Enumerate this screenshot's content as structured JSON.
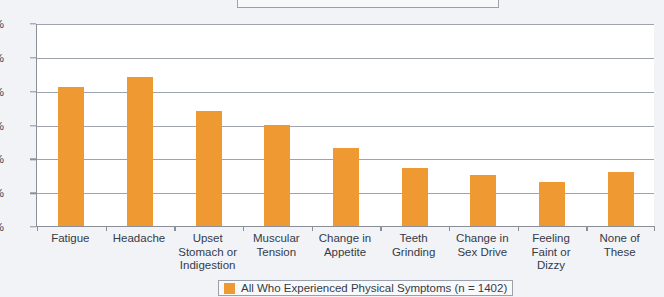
{
  "chart_data": {
    "type": "bar",
    "title": "",
    "xlabel": "",
    "ylabel": "",
    "ylim": [
      0,
      60
    ],
    "ytick_labels": [
      "0%",
      "10%",
      "20%",
      "30%",
      "40%",
      "50%",
      "60%"
    ],
    "ytick_values": [
      0,
      10,
      20,
      30,
      40,
      50,
      60
    ],
    "grid": true,
    "legend_position": "bottom",
    "bar_color": "#ef9932",
    "categories": [
      "Fatigue",
      "Headache",
      "Upset Stomach or Indigestion",
      "Muscular Tension",
      "Change in Appetite",
      "Teeth Grinding",
      "Change in Sex Drive",
      "Feeling Faint or Dizzy",
      "None of These"
    ],
    "category_lines": [
      [
        "Fatigue"
      ],
      [
        "Headache"
      ],
      [
        "Upset",
        "Stomach or",
        "Indigestion"
      ],
      [
        "Muscular",
        "Tension"
      ],
      [
        "Change in",
        "Appetite"
      ],
      [
        "Teeth",
        "Grinding"
      ],
      [
        "Change in",
        "Sex Drive"
      ],
      [
        "Feeling",
        "Faint or",
        "Dizzy"
      ],
      [
        "None of",
        "These"
      ]
    ],
    "values": [
      41,
      44,
      34,
      30,
      23,
      17,
      15,
      13,
      16
    ],
    "series": [
      {
        "name": "All Who Experienced Physical Symptoms (n = 1402)",
        "values": [
          41,
          44,
          34,
          30,
          23,
          17,
          15,
          13,
          16
        ]
      }
    ]
  },
  "legend": {
    "label": "All Who Experienced Physical Symptoms (n = 1402)",
    "swatch_color": "#ef9932"
  }
}
